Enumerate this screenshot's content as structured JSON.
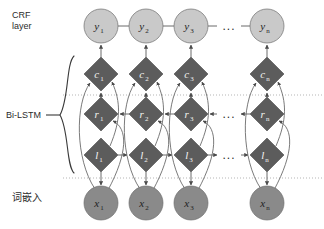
{
  "diagram": {
    "width": 324,
    "height": 229,
    "background": "#ffffff"
  },
  "labels": {
    "crf": "CRF\nlayer",
    "bilstm": "Bi-LSTM",
    "embedding": "词嵌入"
  },
  "colors": {
    "circle_light": "#c9c9c9",
    "circle_medium": "#8a8a8a",
    "diamond_dark": "#5c5c5c",
    "node_stroke": "#6f6f6f",
    "edge": "#6b6b6b",
    "dotted_line": "#b5b5b5",
    "text_dark": "#1f1f1f",
    "text_light": "#1a1a1a",
    "label_text": "#2b2b2b",
    "brace": "#3a3a3a"
  },
  "geometry": {
    "columns_x": [
      101,
      146,
      191,
      267
    ],
    "row_y": {
      "y": 26,
      "c": 74,
      "r": 114,
      "l": 155,
      "x": 203
    },
    "circle_r": 17,
    "diamond_r": 17,
    "dotted_y": [
      95,
      178
    ],
    "dotted_x_range": [
      63,
      324
    ],
    "ellipsis_x": 229,
    "brace": {
      "x": 66,
      "top": 56,
      "bottom": 173,
      "tip_x": 56,
      "tip_y": 115
    }
  },
  "rows": [
    {
      "id": "crf",
      "shape": "circle",
      "fill": "#c9c9c9",
      "y": 26,
      "nodes": [
        {
          "base": "y",
          "sub": "1"
        },
        {
          "base": "y",
          "sub": "2"
        },
        {
          "base": "y",
          "sub": "3"
        },
        {
          "base": "y",
          "sub": "n"
        }
      ],
      "ellipsis": "..."
    },
    {
      "id": "context",
      "shape": "diamond",
      "fill": "#5c5c5c",
      "y": 74,
      "nodes": [
        {
          "base": "c",
          "sub": "1"
        },
        {
          "base": "c",
          "sub": "2"
        },
        {
          "base": "c",
          "sub": "3"
        },
        {
          "base": "c",
          "sub": "n"
        }
      ],
      "ellipsis": ""
    },
    {
      "id": "right-lstm",
      "shape": "diamond",
      "fill": "#5c5c5c",
      "y": 114,
      "direction": "backward",
      "nodes": [
        {
          "base": "r",
          "sub": "1"
        },
        {
          "base": "r",
          "sub": "2"
        },
        {
          "base": "r",
          "sub": "3"
        },
        {
          "base": "r",
          "sub": "n"
        }
      ],
      "ellipsis": "..."
    },
    {
      "id": "left-lstm",
      "shape": "diamond",
      "fill": "#5c5c5c",
      "y": 155,
      "direction": "forward",
      "nodes": [
        {
          "base": "l",
          "sub": "1"
        },
        {
          "base": "l",
          "sub": "2"
        },
        {
          "base": "l",
          "sub": "3"
        },
        {
          "base": "l",
          "sub": "n"
        }
      ],
      "ellipsis": "..."
    },
    {
      "id": "embedding",
      "shape": "circle",
      "fill": "#8a8a8a",
      "y": 203,
      "nodes": [
        {
          "base": "x",
          "sub": "1"
        },
        {
          "base": "x",
          "sub": "2"
        },
        {
          "base": "x",
          "sub": "3"
        },
        {
          "base": "x",
          "sub": "n"
        }
      ],
      "ellipsis": ""
    }
  ]
}
